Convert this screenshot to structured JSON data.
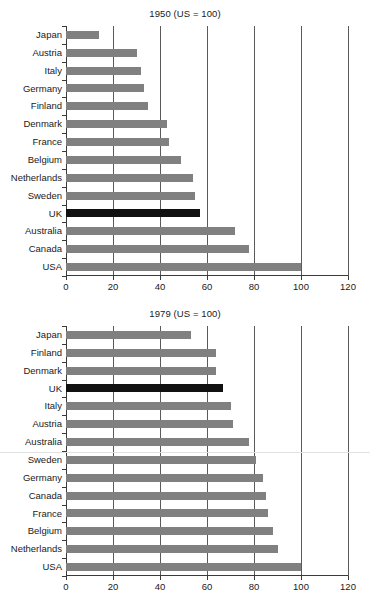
{
  "figure": {
    "background": "#ffffff",
    "bar_color": "#808080",
    "highlight_color": "#111111",
    "highlight_category": "UK",
    "axis_color": "#3a3a3a",
    "gridline_color": "#5a5a5a"
  },
  "panels": [
    {
      "id": "panel-1950",
      "title": "1950 (US = 100)"
    },
    {
      "id": "panel-1979",
      "title": "1979 (US = 100)"
    }
  ],
  "chart_data": [
    {
      "type": "bar",
      "orientation": "horizontal",
      "title": "1950 (US = 100)",
      "xlabel": "",
      "ylabel": "",
      "xlim": [
        0,
        120
      ],
      "xticks": [
        0,
        20,
        40,
        60,
        80,
        100,
        120
      ],
      "xtick_labels": [
        "0",
        "20",
        "40",
        "60",
        "80",
        "100",
        "120"
      ],
      "grid": "vertical",
      "legend": "none",
      "highlight": "UK",
      "categories": [
        "Japan",
        "Austria",
        "Italy",
        "Germany",
        "Finland",
        "Denmark",
        "France",
        "Belgium",
        "Netherlands",
        "Sweden",
        "UK",
        "Australia",
        "Canada",
        "USA"
      ],
      "values": [
        14,
        30,
        32,
        33,
        35,
        43,
        44,
        49,
        54,
        55,
        57,
        72,
        78,
        100
      ]
    },
    {
      "type": "bar",
      "orientation": "horizontal",
      "title": "1979 (US = 100)",
      "xlabel": "",
      "ylabel": "",
      "xlim": [
        0,
        120
      ],
      "xticks": [
        0,
        20,
        40,
        60,
        80,
        100,
        120
      ],
      "xtick_labels": [
        "0",
        "20",
        "40",
        "60",
        "80",
        "100",
        "120"
      ],
      "grid": "vertical",
      "legend": "none",
      "highlight": "UK",
      "categories": [
        "Japan",
        "Finland",
        "Denmark",
        "UK",
        "Italy",
        "Austria",
        "Australia",
        "Sweden",
        "Germany",
        "Canada",
        "France",
        "Belgium",
        "Netherlands",
        "USA"
      ],
      "values": [
        53,
        64,
        64,
        67,
        70,
        71,
        78,
        81,
        84,
        85,
        86,
        88,
        90,
        100
      ]
    }
  ]
}
